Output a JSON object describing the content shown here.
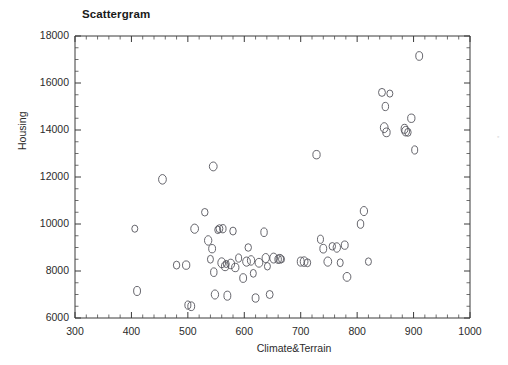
{
  "chart_data": {
    "type": "scatter",
    "title": "Scattergram",
    "xlabel": "Climate&Terrain",
    "ylabel": "Housing",
    "xlim": [
      300,
      1000
    ],
    "ylim": [
      6000,
      18000
    ],
    "xticks": [
      300,
      400,
      500,
      600,
      700,
      800,
      900,
      1000
    ],
    "yticks": [
      6000,
      8000,
      10000,
      12000,
      14000,
      16000,
      18000
    ],
    "xtick_labels": [
      "300",
      "400",
      "500",
      "600",
      "700",
      "800",
      "900",
      "1000"
    ],
    "ytick_labels": [
      "6000",
      "8000",
      "10000",
      "12000",
      "14000",
      "16000",
      "18000"
    ],
    "x_minor_interval": 20,
    "y_minor_interval": 500,
    "grid": false,
    "legend": null,
    "marker": "open-circle",
    "marker_color": "#55555c",
    "points": [
      [
        406,
        9800
      ],
      [
        410,
        7150
      ],
      [
        455,
        11900
      ],
      [
        480,
        8250
      ],
      [
        497,
        8250
      ],
      [
        500,
        6550
      ],
      [
        506,
        6500
      ],
      [
        512,
        9800
      ],
      [
        530,
        10500
      ],
      [
        536,
        9300
      ],
      [
        540,
        8500
      ],
      [
        543,
        8950
      ],
      [
        545,
        12450
      ],
      [
        546,
        7950
      ],
      [
        548,
        7000
      ],
      [
        553,
        9750
      ],
      [
        556,
        9800
      ],
      [
        560,
        8350
      ],
      [
        562,
        9800
      ],
      [
        566,
        8200
      ],
      [
        568,
        8300
      ],
      [
        570,
        6950
      ],
      [
        576,
        8300
      ],
      [
        580,
        9700
      ],
      [
        584,
        8150
      ],
      [
        590,
        8550
      ],
      [
        598,
        7700
      ],
      [
        604,
        8400
      ],
      [
        607,
        9000
      ],
      [
        612,
        8450
      ],
      [
        616,
        7900
      ],
      [
        620,
        6850
      ],
      [
        626,
        8350
      ],
      [
        635,
        9650
      ],
      [
        638,
        8550
      ],
      [
        641,
        8200
      ],
      [
        645,
        7000
      ],
      [
        652,
        8550
      ],
      [
        660,
        8500
      ],
      [
        663,
        8520
      ],
      [
        666,
        8500
      ],
      [
        700,
        8400
      ],
      [
        706,
        8400
      ],
      [
        712,
        8350
      ],
      [
        728,
        12950
      ],
      [
        735,
        9350
      ],
      [
        740,
        8950
      ],
      [
        748,
        8400
      ],
      [
        756,
        9050
      ],
      [
        764,
        9000
      ],
      [
        770,
        8350
      ],
      [
        778,
        9100
      ],
      [
        782,
        7750
      ],
      [
        806,
        10000
      ],
      [
        812,
        10550
      ],
      [
        820,
        8400
      ],
      [
        844,
        15600
      ],
      [
        848,
        14100
      ],
      [
        850,
        15000
      ],
      [
        852,
        13900
      ],
      [
        858,
        15550
      ],
      [
        884,
        14050
      ],
      [
        886,
        13950
      ],
      [
        890,
        13900
      ],
      [
        896,
        14500
      ],
      [
        902,
        13150
      ],
      [
        910,
        17150
      ]
    ]
  }
}
